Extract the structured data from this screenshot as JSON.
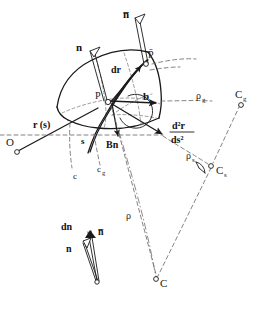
{
  "figure": {
    "background_color": "#ffffff",
    "ink_color": "#1a1a1a",
    "dash_color": "#6e6e6e",
    "width": 267,
    "height": 312
  },
  "labels": {
    "n_bar_top": "n̅",
    "n_top": "n",
    "p_bar": "P̄",
    "p": "P",
    "dr": "dr",
    "b": "b",
    "r_of_s": "r (s)",
    "origin": "O",
    "s": "s",
    "bn": "Bn",
    "d2r_numerator": "d²r",
    "d2r_denominator": "ds²",
    "rho_g": "ρ",
    "rho_g_sub": "g",
    "c_g_upper": "C",
    "c_g_upper_sub": "g",
    "rho_s": "ρ",
    "rho_s_sub": "s",
    "c_s_upper": "C",
    "c_s_upper_sub": "s",
    "rho": "ρ",
    "c_center": "C",
    "c_curve": "c",
    "c_g_lower": "c",
    "c_g_lower_sub": "g",
    "inset_dn": "dn",
    "inset_n_bar": "n̅",
    "inset_n": "n"
  },
  "elements": {
    "surface_patch": "curved quadrilateral surface element",
    "normal_vector_at_p": "hollow outlined arrow n",
    "normal_vector_at_pbar": "hollow outlined arrow n-bar",
    "binormal_arrow": "solid arrow b",
    "curvature_arrow": "solid arrow d2r/ds2",
    "bn_arrow": "solid arrow Bn",
    "geodesic_center_marker": "open circle",
    "normal_center_marker": "open circle",
    "osculating_center_marker": "open circle",
    "origin_marker": "open circle",
    "angle_arc_at_p": "arc indicating angle between vectors",
    "right_angle_marker_cs": "right angle wedge at C_s"
  }
}
